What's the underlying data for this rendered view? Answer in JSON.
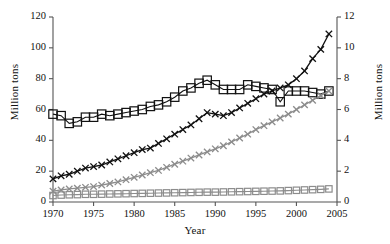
{
  "chart_data": {
    "type": "line",
    "title": "",
    "xlabel": "Year",
    "ylabel": "Million tons",
    "ylabel_right": "Million tons",
    "xlim": [
      1970,
      2005
    ],
    "ylim": [
      0,
      120
    ],
    "ylim_right": [
      0,
      12
    ],
    "grid": false,
    "legend": "none",
    "xticks": [
      1970,
      1975,
      1980,
      1985,
      1990,
      1995,
      2000,
      2005
    ],
    "yticks_left": [
      0,
      20,
      40,
      60,
      80,
      100,
      120
    ],
    "yticks_right": [
      0,
      2,
      4,
      6,
      8,
      10,
      12
    ],
    "x": [
      1970,
      1971,
      1972,
      1973,
      1974,
      1975,
      1976,
      1977,
      1978,
      1979,
      1980,
      1981,
      1982,
      1983,
      1984,
      1985,
      1986,
      1987,
      1988,
      1989,
      1990,
      1991,
      1992,
      1993,
      1994,
      1995,
      1996,
      1997,
      1998,
      1999,
      2000,
      2001,
      2002,
      2003,
      2004
    ],
    "series": [
      {
        "name": "black-square-series",
        "marker": "square",
        "color": "#111111",
        "axis": "left",
        "values": [
          57,
          56,
          51,
          52,
          55,
          55,
          57,
          56,
          57,
          58,
          59,
          60,
          62,
          63,
          65,
          68,
          72,
          74,
          77,
          79,
          76,
          73,
          73,
          73,
          76,
          75,
          74,
          73,
          65,
          72,
          72,
          72,
          71,
          70,
          72
        ]
      },
      {
        "name": "black-x-series",
        "marker": "x",
        "color": "#111111",
        "axis": "right",
        "values": [
          1.5,
          1.7,
          1.8,
          2.0,
          2.2,
          2.3,
          2.4,
          2.6,
          2.8,
          3.0,
          3.2,
          3.4,
          3.5,
          3.8,
          4.1,
          4.4,
          4.7,
          5.0,
          5.4,
          5.8,
          5.7,
          5.6,
          5.8,
          6.1,
          6.4,
          6.7,
          7.0,
          7.2,
          7.4,
          7.6,
          8.0,
          8.5,
          9.3,
          9.9,
          10.9
        ]
      },
      {
        "name": "gray-x-series",
        "marker": "x",
        "color": "#8c8c8c",
        "axis": "right",
        "values": [
          0.7,
          0.78,
          0.85,
          0.9,
          0.95,
          1.0,
          1.1,
          1.2,
          1.3,
          1.45,
          1.6,
          1.75,
          1.9,
          2.05,
          2.25,
          2.45,
          2.65,
          2.85,
          3.05,
          3.25,
          3.45,
          3.65,
          3.9,
          4.15,
          4.4,
          4.7,
          4.95,
          5.2,
          5.45,
          5.7,
          6.0,
          6.3,
          6.6,
          6.9,
          7.2
        ]
      },
      {
        "name": "gray-square-series",
        "marker": "square",
        "color": "#8c8c8c",
        "axis": "right",
        "values": [
          0.42,
          0.45,
          0.47,
          0.48,
          0.5,
          0.5,
          0.51,
          0.52,
          0.53,
          0.54,
          0.55,
          0.56,
          0.57,
          0.58,
          0.59,
          0.6,
          0.61,
          0.62,
          0.63,
          0.64,
          0.64,
          0.65,
          0.66,
          0.67,
          0.68,
          0.69,
          0.7,
          0.71,
          0.72,
          0.74,
          0.76,
          0.78,
          0.8,
          0.82,
          0.85
        ]
      }
    ]
  }
}
